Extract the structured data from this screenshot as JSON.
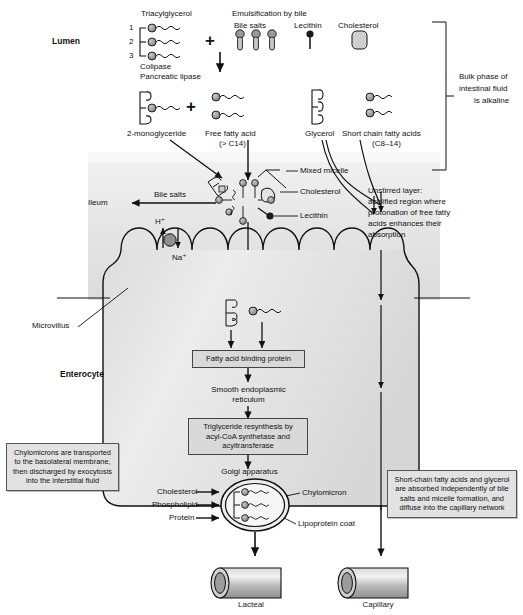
{
  "figure": {
    "type": "biological-process-diagram"
  },
  "regions": {
    "lumen_label": "Lumen",
    "enterocyte_label": "Enterocyte",
    "ileum_label": "Ileum",
    "microvillus_label": "Microvillus"
  },
  "lumen": {
    "triacylglycerol_title": "Triacylglycerol",
    "tag_positions": [
      "1",
      "2",
      "3"
    ],
    "enzymes_line1": "Colipase",
    "enzymes_line2": "Pancreatic lipase",
    "emulsification_title": "Emulsification by bile",
    "bile_salts_label": "Bile salts",
    "lecithin_label": "Lecithin",
    "cholesterol_label": "Cholesterol",
    "plus_sign": "+",
    "products": {
      "monoglyceride": "2-monoglyceride",
      "free_fatty_acid_l1": "Free fatty acid",
      "free_fatty_acid_l2": "(> C14)",
      "glycerol": "Glycerol",
      "short_chain_l1": "Short chain fatty acids",
      "short_chain_l2": "(C8–14)"
    }
  },
  "bulk_phase_note": {
    "line1": "Bulk phase of",
    "line2": "intestinal fluid",
    "line3": "is alkaline"
  },
  "micelle": {
    "mixed_micelle_label": "Mixed micelle",
    "cholesterol_label": "Cholesterol",
    "lecithin_label": "Lecithin",
    "bile_salts_arrow_label": "Bile salts"
  },
  "unstirred_layer_note": {
    "line1": "Unstirred layer:",
    "line2": "acidified region where",
    "line3": "protonation of free fatty",
    "line4": "acids enhances their",
    "line5": "absorption"
  },
  "transporter": {
    "proton_label": "H⁺",
    "sodium_label": "Na⁺"
  },
  "enterocyte_pathway": {
    "fabp_box": "Fatty acid binding protein",
    "ser_l1": "Smooth endoplasmic",
    "ser_l2": "reticulum",
    "resynthesis_l1": "Triglyceride resynthesis by",
    "resynthesis_l2": "acyl-CoA synthetase and",
    "resynthesis_l3": "acyltransferase",
    "golgi_label": "Golgi apparatus"
  },
  "chylomicron": {
    "inputs": [
      "Cholesterol",
      "Phospholipid",
      "Protein"
    ],
    "label": "Chylomicron",
    "coat_label": "Lipoprotein coat"
  },
  "notes": {
    "left_box_l1": "Chylomicrons are transported",
    "left_box_l2": "to the basolateral membrane,",
    "left_box_l3": "then discharged by exocytosis",
    "left_box_l4": "into the interstitial fluid",
    "right_box_l1": "Short-chain fatty acids and glycerol",
    "right_box_l2": "are absorbed independently of bile",
    "right_box_l3": "salts and micelle formation, and",
    "right_box_l4": "diffuse into the capillary network"
  },
  "vessels": {
    "lacteal_label": "Lacteal",
    "capillary_label": "Capillary"
  },
  "colors": {
    "line": "#1a1a1a",
    "fill_gray": "#8d8d8d",
    "box_fill": "#d9d9d9",
    "annot_fill": "#e2e2e2",
    "cell_fill": "#e6e6e6",
    "vessel_fill": "#b4b4b4"
  }
}
